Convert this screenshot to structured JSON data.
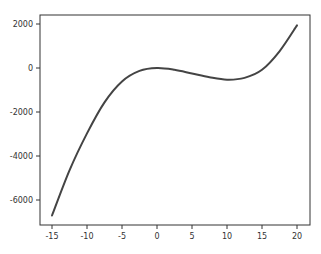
{
  "chart_data": {
    "type": "line",
    "title": "",
    "xlabel": "",
    "ylabel": "",
    "xlim": [
      -16.7,
      21.7
    ],
    "ylim": [
      -7100,
      2400
    ],
    "grid": false,
    "legend": null,
    "x_ticks": [
      -15,
      -10,
      -5,
      0,
      5,
      10,
      15,
      20
    ],
    "x_tick_labels": [
      "-15",
      "-10",
      "-5",
      "0",
      "5",
      "10",
      "15",
      "20"
    ],
    "y_ticks": [
      2000,
      0,
      -2000,
      -4000,
      -6000
    ],
    "y_tick_labels": [
      "2000",
      "0",
      "-2000",
      "-4000",
      "-6000"
    ],
    "series": [
      {
        "name": "curve",
        "color": "#444444",
        "x": [
          -15,
          -12.5,
          -10,
          -7.5,
          -5,
          -2.5,
          0,
          2.5,
          5,
          7.5,
          10,
          12.5,
          15,
          17.5,
          20
        ],
        "values": [
          -6705,
          -4652,
          -2970,
          -1560,
          -610,
          -130,
          0,
          -80,
          -250,
          -420,
          -530,
          -450,
          -80,
          760,
          1940
        ]
      }
    ]
  }
}
